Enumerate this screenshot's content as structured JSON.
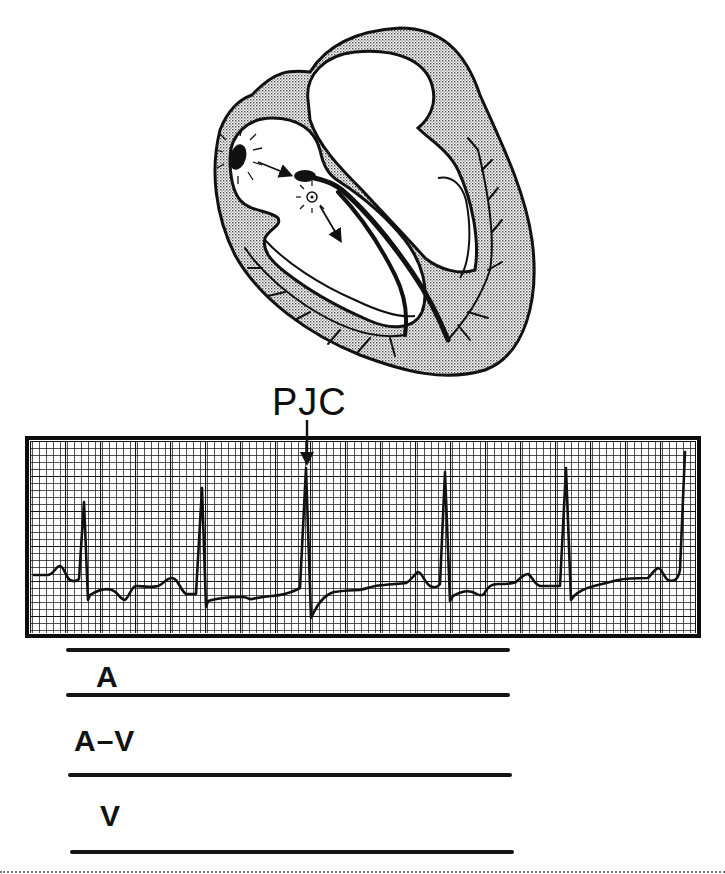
{
  "figure": {
    "heart": {
      "chambers": [
        "right-atrium",
        "left-atrium",
        "right-ventricle",
        "left-ventricle"
      ],
      "markers": [
        {
          "name": "sa-node",
          "shape": "filled-oval",
          "rays": true
        },
        {
          "name": "av-junction-ectopic-focus",
          "shape": "open-circle-with-dot",
          "rays": true
        },
        {
          "name": "av-node",
          "shape": "filled-teardrop"
        }
      ],
      "arrows": [
        {
          "from": "sa-node",
          "to": "av-node"
        },
        {
          "from": "av-junction-ectopic-focus",
          "direction": "down-into-ventricle"
        }
      ],
      "wall_fill": "stippled-gray",
      "colors": {
        "outline": "#111111",
        "wall": "#cfcfcf",
        "cavity": "#ffffff"
      }
    },
    "annotation": {
      "label": "PJC",
      "arrow_target_beat_index": 2
    },
    "ecg_strip": {
      "grid": {
        "minor_px": 7,
        "major_every": 5,
        "line_color": "#1a1a1a",
        "paper_color": "#ffffff"
      },
      "beats": [
        {
          "index": 0,
          "x": 85,
          "type": "sinus",
          "p_wave": true
        },
        {
          "index": 1,
          "x": 205,
          "type": "sinus",
          "p_wave": true
        },
        {
          "index": 2,
          "x": 308,
          "type": "PJC",
          "p_wave": false
        },
        {
          "index": 3,
          "x": 447,
          "type": "sinus",
          "p_wave": true
        },
        {
          "index": 4,
          "x": 568,
          "type": "sinus",
          "p_wave": true
        },
        {
          "index": 5,
          "x": 685,
          "type": "sinus",
          "p_wave": true
        }
      ]
    },
    "ladder": {
      "rows": [
        {
          "label": "A"
        },
        {
          "label": "A–V"
        },
        {
          "label": "V"
        }
      ]
    }
  }
}
